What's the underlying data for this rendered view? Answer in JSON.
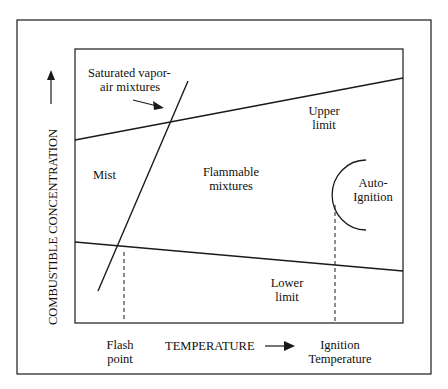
{
  "diagram": {
    "y_axis_label": "COMBUSTIBLE CONCENTRATION",
    "x_axis_label": "TEMPERATURE",
    "regions": {
      "saturated": [
        "Saturated vapor-",
        "air mixtures"
      ],
      "mist": "Mist",
      "flammable": [
        "Flammable",
        "mixtures"
      ],
      "upper_limit": [
        "Upper",
        "limit"
      ],
      "lower_limit": [
        "Lower",
        "limit"
      ],
      "auto_ignition": [
        "Auto-",
        "Ignition"
      ]
    },
    "x_markers": {
      "flash_point": [
        "Flash",
        "point"
      ],
      "ignition_temperature": [
        "Ignition",
        "Temperature"
      ]
    },
    "colors": {
      "line": "#1a1a1a",
      "background": "#ffffff"
    }
  }
}
